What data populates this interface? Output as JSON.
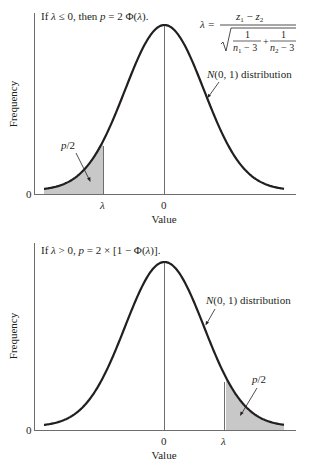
{
  "chart_data": [
    {
      "type": "area",
      "title": "If λ ≤ 0, then p = 2 Φ(λ).",
      "xlabel": "Value",
      "ylabel": "Frequency",
      "x_ticks": [
        "λ",
        "0"
      ],
      "y_ticks": [
        "0"
      ],
      "curve": "standard normal density N(0, 1)",
      "x_range_sigma": [
        -3,
        3
      ],
      "lambda_sigma": -1.55,
      "shaded_region": "left tail, x < λ",
      "annotations": {
        "distribution": "N(0, 1) distribution",
        "tail": "p/2",
        "formula": {
          "lhs": "λ =",
          "numerator": "z₁ − z₂",
          "denominator_terms": [
            "1 / (n₁ − 3)",
            "1 / (n₂ − 3)"
          ],
          "denominator": "√( 1/(n₁ − 3) + 1/(n₂ − 3) )"
        }
      },
      "grid": false,
      "legend": "none"
    },
    {
      "type": "area",
      "title": "If λ > 0, p = 2 × [1 − Φ(λ)].",
      "xlabel": "Value",
      "ylabel": "Frequency",
      "x_ticks": [
        "0",
        "λ"
      ],
      "y_ticks": [
        "0"
      ],
      "curve": "standard normal density N(0, 1)",
      "x_range_sigma": [
        -3,
        3
      ],
      "lambda_sigma": 1.55,
      "shaded_region": "right tail, x > λ",
      "annotations": {
        "distribution": "N(0, 1) distribution",
        "tail": "p/2"
      },
      "grid": false,
      "legend": "none"
    }
  ],
  "top": {
    "title_pre": "If ",
    "title_lambda": "λ",
    "title_mid": " ≤ 0, then ",
    "title_p": "p",
    "title_post": " = 2 Φ(",
    "title_lambda2": "λ",
    "title_end": ").",
    "formula_lhs": "λ =",
    "formula_num_z1": "z",
    "formula_num_sub1": "1",
    "formula_num_minus": " − ",
    "formula_num_z2": "z",
    "formula_num_sub2": "2",
    "formula_one": "1",
    "formula_n": "n",
    "formula_sub1": "1",
    "formula_sub2": "2",
    "formula_minus3": " − 3",
    "formula_plus": "+",
    "dist_N": "N",
    "dist_rest": "(0, 1) distribution",
    "tail_p": "p",
    "tail_rest": "/2",
    "ylabel": "Frequency",
    "y_zero": "0",
    "x_lambda": "λ",
    "x_zero": "0",
    "xlabel": "Value"
  },
  "bottom": {
    "title_pre": "If ",
    "title_lambda": "λ",
    "title_mid": " > 0, ",
    "title_p": "p",
    "title_post": " = 2 × [1 − Φ(",
    "title_lambda2": "λ",
    "title_end": ")].",
    "dist_N": "N",
    "dist_rest": "(0, 1) distribution",
    "tail_p": "p",
    "tail_rest": "/2",
    "ylabel": "Frequency",
    "y_zero": "0",
    "x_zero": "0",
    "x_lambda": "λ",
    "xlabel": "Value"
  },
  "colors": {
    "ink": "#231f20",
    "shade": "#c8c8c8",
    "axis": "#6d6d6d"
  }
}
